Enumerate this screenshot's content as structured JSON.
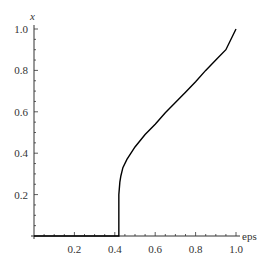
{
  "chart_data": {
    "type": "line",
    "title": "",
    "xlabel": "eps",
    "ylabel": "x",
    "xlim": [
      0,
      1.0
    ],
    "ylim": [
      0,
      1.0
    ],
    "grid": false,
    "legend": null,
    "x_ticks": [
      "0.2",
      "0.4",
      "0.6",
      "0.8",
      "1.0"
    ],
    "y_ticks": [
      "0.2",
      "0.4",
      "0.6",
      "0.8",
      "1.0"
    ],
    "series": [
      {
        "name": "x(eps)",
        "color": "#000000",
        "points": [
          [
            0.0,
            0.0
          ],
          [
            0.1,
            0.0
          ],
          [
            0.2,
            0.0
          ],
          [
            0.3,
            0.0
          ],
          [
            0.4,
            0.0
          ],
          [
            0.42,
            0.0
          ],
          [
            0.42,
            0.12
          ],
          [
            0.42,
            0.2
          ],
          [
            0.425,
            0.26
          ],
          [
            0.43,
            0.29
          ],
          [
            0.44,
            0.33
          ],
          [
            0.46,
            0.37
          ],
          [
            0.48,
            0.4
          ],
          [
            0.5,
            0.43
          ],
          [
            0.55,
            0.49
          ],
          [
            0.6,
            0.54
          ],
          [
            0.65,
            0.595
          ],
          [
            0.7,
            0.645
          ],
          [
            0.75,
            0.695
          ],
          [
            0.8,
            0.745
          ],
          [
            0.85,
            0.8
          ],
          [
            0.9,
            0.85
          ],
          [
            0.95,
            0.9
          ],
          [
            1.0,
            1.0
          ]
        ]
      }
    ]
  }
}
